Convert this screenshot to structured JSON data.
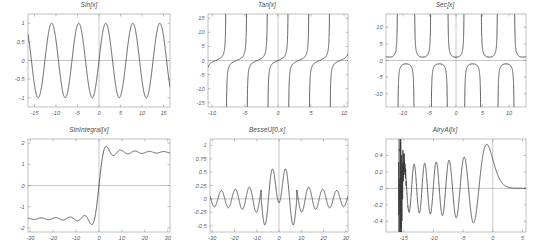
{
  "page": {
    "background": "#ffffff",
    "curve_color": "#3a3a3a",
    "frame_color": "#808080",
    "axis_color": "#9a9a9a",
    "label_color": "#5a5a5a"
  },
  "chart_data": [
    {
      "type": "line",
      "title": "Sin[x]",
      "xlabel": "",
      "ylabel": "",
      "function": "sin(x)",
      "xlim": [
        -16.5,
        16.5
      ],
      "ylim": [
        -1.25,
        1.25
      ],
      "xticks": [
        -15,
        -10,
        -5,
        0,
        5,
        10,
        15
      ],
      "xticklabels": [
        "-15",
        "-10",
        "-5",
        "0",
        "5",
        "10",
        "15"
      ],
      "yticks": [
        -1,
        -0.5,
        0,
        0.5,
        1
      ],
      "yticklabels": [
        "-1",
        "-0.5",
        "0",
        "0.5",
        "1"
      ],
      "grid": false,
      "legend": "none"
    },
    {
      "type": "line",
      "title": "Tan[x]",
      "xlabel": "",
      "ylabel": "",
      "function": "tan(x)",
      "xlim": [
        -10.6,
        10.6
      ],
      "ylim": [
        -16.5,
        16.5
      ],
      "xticks": [
        -10,
        -5,
        0,
        5,
        10
      ],
      "xticklabels": [
        "-10",
        "-5",
        "0",
        "5",
        "10"
      ],
      "yticks": [
        -15,
        -10,
        -5,
        0,
        5,
        10,
        15
      ],
      "yticklabels": [
        "-15",
        "-10",
        "-5",
        "0",
        "5",
        "10",
        "15"
      ],
      "grid": false,
      "legend": "none"
    },
    {
      "type": "line",
      "title": "Sec[x]",
      "xlabel": "",
      "ylabel": "",
      "function": "sec(x)",
      "xlim": [
        -13.2,
        13.2
      ],
      "ylim": [
        -14,
        14
      ],
      "xticks": [
        -10,
        -5,
        0,
        5,
        10
      ],
      "xticklabels": [
        "-10",
        "-5",
        "0",
        "5",
        "10"
      ],
      "yticks": [
        -10,
        -5,
        0,
        5,
        10
      ],
      "yticklabels": [
        "-10",
        "-5",
        "0",
        "5",
        "10"
      ],
      "grid": false,
      "legend": "none"
    },
    {
      "type": "line",
      "title": "SinIntegral[x]",
      "xlabel": "",
      "ylabel": "",
      "function": "Si(x)",
      "xlim": [
        -31,
        31
      ],
      "ylim": [
        -2.2,
        2.2
      ],
      "xticks": [
        -30,
        -20,
        -10,
        0,
        10,
        20,
        30
      ],
      "xticklabels": [
        "-30",
        "-20",
        "-10",
        "0",
        "10",
        "20",
        "30"
      ],
      "yticks": [
        -2,
        -1,
        0,
        1,
        2
      ],
      "yticklabels": [
        "-2",
        "-1",
        "0",
        "1",
        "2"
      ],
      "grid": false,
      "legend": "none"
    },
    {
      "type": "line",
      "title": "BesselJ[0,x]",
      "xlabel": "",
      "ylabel": "",
      "function": "J0(x)",
      "xlim": [
        -31,
        31
      ],
      "ylim": [
        -0.62,
        1.12
      ],
      "xticks": [
        -30,
        -20,
        -10,
        0,
        10,
        20,
        30
      ],
      "xticklabels": [
        "-30",
        "-20",
        "-10",
        "0",
        "10",
        "20",
        "30"
      ],
      "yticks": [
        -0.5,
        -0.25,
        0,
        0.25,
        0.5,
        0.75,
        1
      ],
      "yticklabels": [
        "-0.5",
        "-0.25",
        "0",
        "0.25",
        "0.5",
        "0.75",
        "1"
      ],
      "grid": false,
      "legend": "none"
    },
    {
      "type": "line",
      "title": "AiryAi[x]",
      "xlabel": "",
      "ylabel": "",
      "function": "Ai(x)",
      "xlim": [
        -18,
        5.6
      ],
      "ylim": [
        -0.53,
        0.6
      ],
      "xticks": [
        -15,
        -10,
        -5,
        0,
        5
      ],
      "xticklabels": [
        "-15",
        "-10",
        "-5",
        "0",
        "5"
      ],
      "yticks": [
        -0.4,
        -0.2,
        0,
        0.2,
        0.4
      ],
      "yticklabels": [
        "-0.4",
        "-0.2",
        "0",
        "0.2",
        "0.4"
      ],
      "grid": false,
      "legend": "none"
    }
  ]
}
